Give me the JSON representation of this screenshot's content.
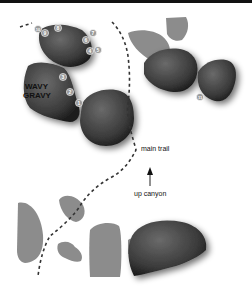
{
  "map": {
    "labels": {
      "area_name_line1": "WAVY",
      "area_name_line2": "GRAVY",
      "trail": "main trail",
      "direction": "up canyon"
    },
    "problem_markers": [
      {
        "n": "10",
        "x": 38,
        "y": 29
      },
      {
        "n": "9",
        "x": 45,
        "y": 33
      },
      {
        "n": "8",
        "x": 58,
        "y": 28
      },
      {
        "n": "7",
        "x": 93,
        "y": 33
      },
      {
        "n": "6",
        "x": 86,
        "y": 40
      },
      {
        "n": "4",
        "x": 90,
        "y": 51
      },
      {
        "n": "5",
        "x": 98,
        "y": 50
      },
      {
        "n": "3",
        "x": 63,
        "y": 77
      },
      {
        "n": "2",
        "x": 70,
        "y": 92
      },
      {
        "n": "1",
        "x": 79,
        "y": 103
      },
      {
        "n": "11",
        "x": 200,
        "y": 97
      }
    ],
    "colors": {
      "boulder_dark": "#3a3a3a",
      "boulder_light": "#8a8a8a",
      "trail": "#333333",
      "marker_fill": "#9a9a9a",
      "background": "#ffffff"
    }
  }
}
